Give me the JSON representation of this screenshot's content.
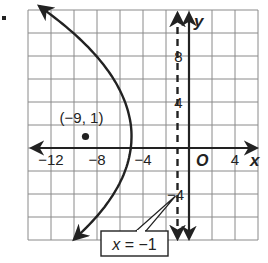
{
  "figure": {
    "type": "parabola-graph",
    "axes": {
      "x_label": "x",
      "y_label": "y",
      "origin_label": "O",
      "x_range": [
        -14,
        6
      ],
      "y_range": [
        -8,
        12
      ],
      "grid_step": 2,
      "x_ticks": [
        {
          "value": -12,
          "label": "−12"
        },
        {
          "value": -8,
          "label": "−8"
        },
        {
          "value": -4,
          "label": "−4"
        },
        {
          "value": 4,
          "label": "4"
        }
      ],
      "y_ticks": [
        {
          "value": 8,
          "label": "8"
        },
        {
          "value": 4,
          "label": "4"
        },
        {
          "value": -4,
          "label": "−4"
        }
      ]
    },
    "parabola": {
      "vertex": [
        -5,
        1
      ],
      "focus": [
        -9,
        1
      ],
      "opens": "left",
      "equation": "x = -5 - (y-1)^2/16"
    },
    "focus_point": {
      "x": -9,
      "y": 1,
      "label": "(−9, 1)"
    },
    "directrix": {
      "x": -1,
      "label": "x = −1",
      "style": "dashed"
    },
    "colors": {
      "ink": "#222222",
      "grid": "#8a8a8a",
      "background": "#ffffff"
    }
  }
}
